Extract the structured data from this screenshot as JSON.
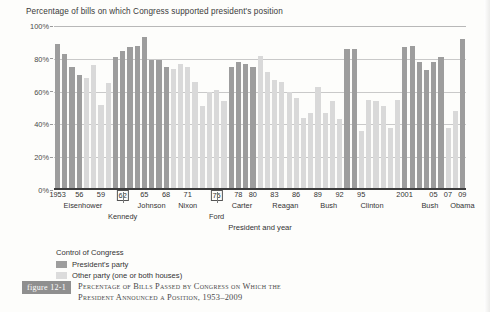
{
  "chart_data": {
    "type": "bar",
    "title": "Percentage of bills on which Congress supported president's position",
    "xlabel": "President and year",
    "ylabel": "",
    "ylim": [
      0,
      100
    ],
    "grid": true,
    "legend_position": "below-left",
    "y_ticks": [
      "0%",
      "20%",
      "40%",
      "60%",
      "80%",
      "100%"
    ],
    "y_tick_values": [
      0,
      20,
      40,
      60,
      80,
      100
    ],
    "legend_title": "Control of Congress",
    "legend": [
      {
        "key": "pres",
        "label": "President's party",
        "color": "#9d9d9d"
      },
      {
        "key": "other",
        "label": "Other party (one or both houses)",
        "color": "#dcdcdc"
      }
    ],
    "categories": [
      1953,
      1954,
      1955,
      1956,
      1957,
      1958,
      1959,
      1960,
      1961,
      1962,
      1963,
      1964,
      1965,
      1966,
      1967,
      1968,
      1969,
      1970,
      1971,
      1972,
      1973,
      1974,
      1975,
      1976,
      1977,
      1978,
      1979,
      1980,
      1981,
      1982,
      1983,
      1984,
      1985,
      1986,
      1987,
      1988,
      1989,
      1990,
      1991,
      1992,
      1993,
      1994,
      1995,
      1996,
      1997,
      1998,
      1999,
      2000,
      2001,
      2002,
      2003,
      2004,
      2005,
      2006,
      2007,
      2008,
      2009
    ],
    "values": [
      89,
      83,
      75,
      70,
      68,
      76,
      52,
      65,
      81,
      85,
      87,
      88,
      93,
      79,
      79,
      75,
      74,
      77,
      75,
      66,
      51,
      60,
      61,
      54,
      75,
      78,
      77,
      75,
      82,
      72,
      67,
      66,
      60,
      56,
      44,
      47,
      63,
      47,
      54,
      43,
      86,
      86,
      36,
      55,
      54,
      51,
      38,
      55,
      87,
      88,
      78,
      73,
      78,
      81,
      38,
      48,
      92
    ],
    "series_keys": [
      "pres",
      "pres",
      "pres",
      "pres",
      "other",
      "other",
      "other",
      "other",
      "pres",
      "pres",
      "pres",
      "pres",
      "pres",
      "pres",
      "pres",
      "pres",
      "other",
      "other",
      "other",
      "other",
      "other",
      "other",
      "other",
      "other",
      "pres",
      "pres",
      "pres",
      "pres",
      "other",
      "other",
      "other",
      "other",
      "other",
      "other",
      "other",
      "other",
      "other",
      "other",
      "other",
      "other",
      "pres",
      "pres",
      "other",
      "other",
      "other",
      "other",
      "other",
      "other",
      "pres",
      "pres",
      "pres",
      "pres",
      "pres",
      "pres",
      "other",
      "other",
      "pres"
    ],
    "year_labels": [
      {
        "text": "1953",
        "year": 1953,
        "boxed": false
      },
      {
        "text": "56",
        "year": 1956,
        "boxed": false
      },
      {
        "text": "59",
        "year": 1959,
        "boxed": false
      },
      {
        "text": "62",
        "year": 1962,
        "boxed": true
      },
      {
        "text": "65",
        "year": 1965,
        "boxed": false
      },
      {
        "text": "68",
        "year": 1968,
        "boxed": false
      },
      {
        "text": "71",
        "year": 1971,
        "boxed": false
      },
      {
        "text": "75",
        "year": 1975,
        "boxed": true
      },
      {
        "text": "78",
        "year": 1978,
        "boxed": false
      },
      {
        "text": "80",
        "year": 1980,
        "boxed": false
      },
      {
        "text": "83",
        "year": 1983,
        "boxed": false
      },
      {
        "text": "86",
        "year": 1986,
        "boxed": false
      },
      {
        "text": "89",
        "year": 1989,
        "boxed": false
      },
      {
        "text": "92",
        "year": 1992,
        "boxed": false
      },
      {
        "text": "95",
        "year": 1995,
        "boxed": false
      },
      {
        "text": "2001",
        "year": 2001,
        "boxed": false
      },
      {
        "text": "05",
        "year": 2005,
        "boxed": false
      },
      {
        "text": "07",
        "year": 2007,
        "boxed": false
      },
      {
        "text": "09",
        "year": 2009,
        "boxed": false
      }
    ],
    "president_labels": [
      {
        "name": "Eisenhower",
        "center_year": 1956.5,
        "row": 1
      },
      {
        "name": "Kennedy",
        "center_year": 1962.0,
        "row": 2
      },
      {
        "name": "Johnson",
        "center_year": 1966.0,
        "row": 1
      },
      {
        "name": "Nixon",
        "center_year": 1971.0,
        "row": 1
      },
      {
        "name": "Ford",
        "center_year": 1975.0,
        "row": 2
      },
      {
        "name": "Carter",
        "center_year": 1978.5,
        "row": 1
      },
      {
        "name": "Reagan",
        "center_year": 1984.5,
        "row": 1
      },
      {
        "name": "Bush",
        "center_year": 1990.5,
        "row": 1
      },
      {
        "name": "Clinton",
        "center_year": 1996.5,
        "row": 1
      },
      {
        "name": "Bush",
        "center_year": 2004.5,
        "row": 1
      },
      {
        "name": "Obama",
        "center_year": 2009.0,
        "row": 1
      }
    ],
    "separator_years": [
      1961,
      1963,
      1969,
      1974,
      1977,
      1981,
      1989,
      1993,
      2001,
      2009
    ]
  },
  "caption": {
    "figure_tag": "figure 12-1",
    "line1": "Percentage of Bills Passed by Congress on Which the",
    "line2": "President Announced a Position, 1953–2009"
  },
  "colors": {
    "pres_party": "#9d9d9d",
    "other_party": "#dcdcdc",
    "axis": "#3c3c3c",
    "grid": "#c9c9c9",
    "tag_bg": "#8f8f8f"
  }
}
